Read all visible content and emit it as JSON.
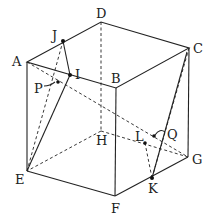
{
  "diagram": {
    "type": "cube-geometry",
    "vertices": {
      "A": {
        "label": "A",
        "x": 27,
        "y": 62
      },
      "B": {
        "label": "B",
        "x": 116,
        "y": 88
      },
      "C": {
        "label": "C",
        "x": 189,
        "y": 48
      },
      "D": {
        "label": "D",
        "x": 101,
        "y": 22
      },
      "E": {
        "label": "E",
        "x": 27,
        "y": 171
      },
      "F": {
        "label": "F",
        "x": 115,
        "y": 196
      },
      "G": {
        "label": "G",
        "x": 188,
        "y": 157
      },
      "H": {
        "label": "H",
        "x": 101,
        "y": 131
      }
    },
    "points": {
      "I": {
        "label": "I",
        "x": 70,
        "y": 75
      },
      "J": {
        "label": "J",
        "x": 63,
        "y": 41
      },
      "K": {
        "label": "K",
        "x": 152,
        "y": 178
      },
      "L": {
        "label": "L",
        "x": 145,
        "y": 143
      },
      "P": {
        "label": "P",
        "x": 58,
        "y": 82
      },
      "Q": {
        "label": "Q",
        "x": 154,
        "y": 136
      }
    }
  }
}
